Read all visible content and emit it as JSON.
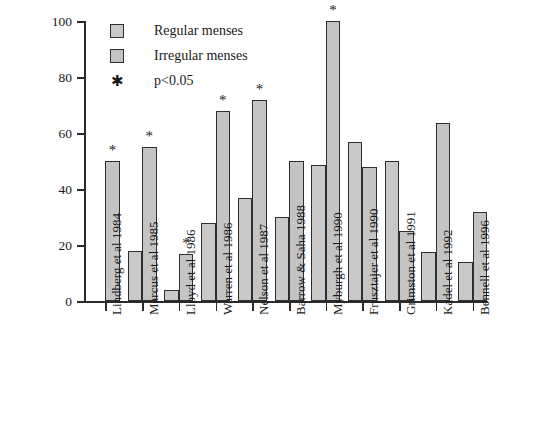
{
  "chart_data": {
    "type": "bar",
    "title": "",
    "xlabel": "",
    "ylabel": "% of athletes with stress fractures",
    "ylim": [
      0,
      100
    ],
    "yticks": [
      0,
      20,
      40,
      60,
      80,
      100
    ],
    "grid": false,
    "legend_position": "top-left",
    "categories": [
      "Lindberg et al 1984",
      "Marcus et al 1985",
      "Lloyd et al 1986",
      "Warren et al 1986",
      "Nelson et al 1987",
      "Barrow & Saha 1988",
      "Myburgh et al 1990",
      "Frusztajer et al 1990",
      "Grimston et al 1991",
      "Kadel et al 1992",
      "Bennell et al 1996"
    ],
    "series": [
      {
        "name": "Regular menses",
        "values": [
          null,
          18,
          4,
          28,
          37,
          30,
          48.5,
          57,
          50,
          17.5,
          14
        ]
      },
      {
        "name": "Irregular menses",
        "values": [
          50,
          55,
          17,
          68,
          72,
          50,
          100,
          48,
          25,
          63.5,
          32
        ]
      }
    ],
    "significance_markers": {
      "symbol": "*",
      "note": "p<0.05",
      "marked": [
        {
          "category": "Lindberg et al 1984",
          "series": "Irregular menses",
          "value": 50
        },
        {
          "category": "Marcus et al 1985",
          "series": "Irregular menses",
          "value": 55
        },
        {
          "category": "Lloyd et al 1986",
          "series": "Irregular menses",
          "value": 17
        },
        {
          "category": "Warren et al 1986",
          "series": "Irregular menses",
          "value": 68
        },
        {
          "category": "Nelson et al 1987",
          "series": "Irregular menses",
          "value": 72
        },
        {
          "category": "Myburgh et al 1990",
          "series": "Irregular menses",
          "value": 100
        }
      ]
    }
  },
  "legend": {
    "items": [
      {
        "label": "Regular menses",
        "swatch": "regular"
      },
      {
        "label": "Irregular menses",
        "swatch": "irregular"
      },
      {
        "label": "p<0.05",
        "swatch": "star"
      }
    ]
  },
  "axis": {
    "y_title": "% of athletes with stress fractures",
    "y_ticks": [
      "0",
      "20",
      "40",
      "60",
      "80",
      "100"
    ]
  }
}
